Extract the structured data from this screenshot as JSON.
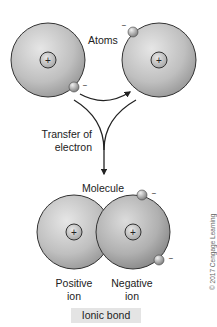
{
  "diagram": {
    "title": "Ionic bond",
    "labels": {
      "atoms": "Atoms",
      "transfer": [
        "Transfer of",
        "electron"
      ],
      "molecule": "Molecule",
      "positive_ion": [
        "Positive",
        "ion"
      ],
      "negative_ion": [
        "Negative",
        "ion"
      ]
    },
    "symbols": {
      "nucleus": "+",
      "electron": "−"
    },
    "copyright": "© 2017 Cengage Learning",
    "colors": {
      "atom_fill": "#bdbdbd",
      "atom_stroke": "#333333",
      "arrow": "#222222",
      "caption_bg": "#e4e4e4"
    }
  }
}
